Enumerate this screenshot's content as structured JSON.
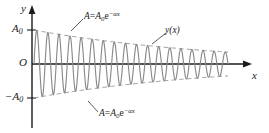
{
  "figure": {
    "axes": {
      "y_axis_label": "y",
      "x_axis_label": "x",
      "origin_label": "O",
      "positive_amplitude_label": "A",
      "positive_amplitude_sub": "0",
      "negative_amplitude_label": "−A",
      "negative_amplitude_sub": "0"
    },
    "annotations": {
      "upper_envelope": {
        "lhs": "A",
        "eq": "=",
        "rhs_A": "A",
        "rhs_sub": "0",
        "rhs_e": "e",
        "rhs_exp": "−αx"
      },
      "lower_envelope": {
        "lhs": "A",
        "eq": "=",
        "rhs_A": "A",
        "rhs_sub": "0",
        "rhs_e": "e",
        "rhs_exp": "−αx"
      },
      "curve": "y(x)"
    },
    "colors": {
      "background": "#ffffff",
      "axis": "#1b1b1b",
      "curve": "#8a8a8a",
      "envelope": "#9a9a9a",
      "leader": "#4a4a4a",
      "text": "#1b1b1b"
    }
  },
  "chart_data": {
    "type": "line",
    "xlabel": "x",
    "ylabel": "y",
    "xlim": [
      0,
      1
    ],
    "ylim": [
      -1,
      1
    ],
    "grid": false,
    "legend": "none",
    "equation": "y(x) = A0 * e^(-alpha*x) * sin(2*pi*n*x)",
    "parameters": {
      "A0": 1,
      "alpha": 1.05,
      "cycles": 17.5,
      "samples": 1400
    },
    "envelope_upper_equation": "A = A0*e^(-alpha*x)",
    "envelope_lower_equation": "A = -A0*e^(-alpha*x)",
    "envelope_x": [
      0,
      0.125,
      0.25,
      0.375,
      0.5,
      0.625,
      0.75,
      0.875,
      1
    ],
    "envelope_upper_y": [
      1.0,
      0.877,
      0.769,
      0.674,
      0.591,
      0.518,
      0.454,
      0.398,
      0.35
    ],
    "envelope_lower_y": [
      -1.0,
      -0.877,
      -0.769,
      -0.674,
      -0.591,
      -0.518,
      -0.454,
      -0.398,
      -0.35
    ],
    "tick_labels_y": [
      "A0",
      "O",
      "-A0"
    ],
    "tick_values_y": [
      1,
      0,
      -1
    ]
  }
}
